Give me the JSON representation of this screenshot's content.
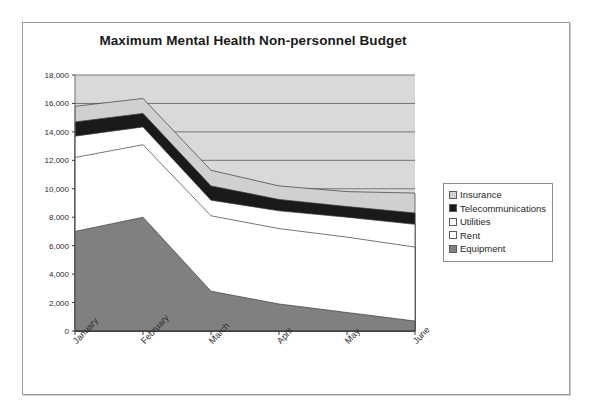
{
  "chart_data": {
    "type": "area",
    "title": "Maximum Mental Health Non-personnel Budget",
    "xlabel": "",
    "ylabel": "",
    "stacked": true,
    "grid": true,
    "legend_position": "right",
    "categories": [
      "January",
      "February",
      "March",
      "April",
      "May",
      "June"
    ],
    "ylim": [
      0,
      18000
    ],
    "yticks": [
      0,
      2000,
      4000,
      6000,
      8000,
      10000,
      12000,
      14000,
      16000,
      18000
    ],
    "ytick_labels": [
      "0",
      "2,000",
      "4,000",
      "6,000",
      "8,000",
      "10,000",
      "12,000",
      "14,000",
      "16,000",
      "18,000"
    ],
    "series": [
      {
        "name": "Equipment",
        "color": "#808080",
        "values": [
          7000,
          8000,
          2800,
          1900,
          1300,
          700
        ],
        "cumulative_top": [
          7000,
          8000,
          2800,
          1900,
          1300,
          700
        ]
      },
      {
        "name": "Rent",
        "color": "#ffffff",
        "values": [
          5200,
          5100,
          5300,
          5300,
          5300,
          5200
        ],
        "cumulative_top": [
          12200,
          13100,
          8100,
          7200,
          6600,
          5900
        ]
      },
      {
        "name": "Utilities",
        "color": "#ffffff",
        "values": [
          1500,
          1250,
          1100,
          1250,
          1400,
          1600
        ],
        "cumulative_top": [
          13700,
          14350,
          9200,
          8450,
          8000,
          7500
        ]
      },
      {
        "name": "Telecommunications",
        "color": "#1a1a1a",
        "values": [
          1000,
          950,
          1000,
          800,
          750,
          800
        ],
        "cumulative_top": [
          14700,
          15300,
          10200,
          9250,
          8750,
          8300
        ]
      },
      {
        "name": "Insurance",
        "color": "#d0d0d0",
        "values": [
          1100,
          1050,
          1100,
          950,
          1050,
          1400
        ],
        "cumulative_top": [
          15800,
          16350,
          11300,
          10200,
          9800,
          9700
        ]
      }
    ],
    "legend_entries": [
      {
        "label": "Insurance",
        "swatch": "#d0d0d0"
      },
      {
        "label": "Telecommunications",
        "swatch": "#1a1a1a"
      },
      {
        "label": "Utilities",
        "swatch": "#ffffff"
      },
      {
        "label": "Rent",
        "swatch": "#ffffff"
      },
      {
        "label": "Equipment",
        "swatch": "#808080"
      }
    ]
  }
}
